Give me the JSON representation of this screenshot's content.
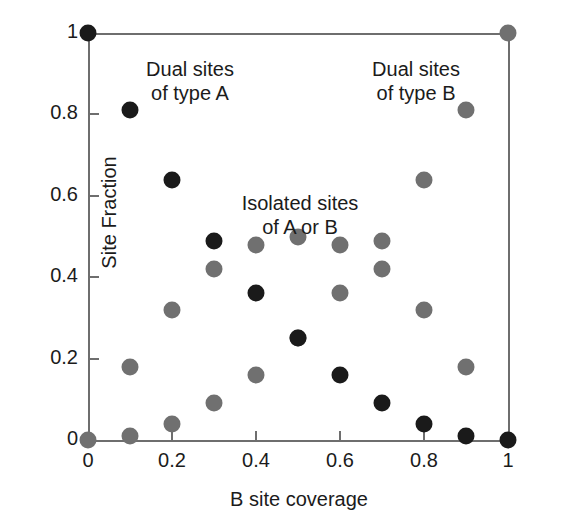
{
  "chart_data": {
    "type": "scatter",
    "title": "",
    "xlabel": "B site coverage",
    "ylabel": "Site Fraction",
    "xlim": [
      0,
      1
    ],
    "ylim": [
      0,
      1
    ],
    "grid": false,
    "legend": "none",
    "xticks": [
      "0",
      "0.2",
      "0.4",
      "0.6",
      "0.8",
      "1"
    ],
    "xtick_values": [
      0,
      0.2,
      0.4,
      0.6,
      0.8,
      1
    ],
    "yticks": [
      "0",
      "0.2",
      "0.4",
      "0.6",
      "0.8",
      "1"
    ],
    "ytick_values": [
      0,
      0.2,
      0.4,
      0.6,
      0.8,
      1
    ],
    "colors": {
      "dark": "#1a1a1a",
      "gray": "#707070",
      "axis": "#6e6e6e",
      "text": "#1b1b1b",
      "background": "#ffffff"
    },
    "series": [
      {
        "name": "Dual sites of type A",
        "color": "#1a1a1a",
        "points": [
          {
            "x": 0.0,
            "y": 1.0
          },
          {
            "x": 0.1,
            "y": 0.81
          },
          {
            "x": 0.2,
            "y": 0.64
          },
          {
            "x": 0.3,
            "y": 0.49
          },
          {
            "x": 0.4,
            "y": 0.36
          },
          {
            "x": 0.5,
            "y": 0.25
          },
          {
            "x": 0.6,
            "y": 0.16
          },
          {
            "x": 0.7,
            "y": 0.09
          },
          {
            "x": 0.8,
            "y": 0.04
          },
          {
            "x": 0.9,
            "y": 0.01
          },
          {
            "x": 1.0,
            "y": 0.0
          }
        ]
      },
      {
        "name": "Dual sites of type B",
        "color": "#707070",
        "points": [
          {
            "x": 0.0,
            "y": 0.0
          },
          {
            "x": 0.1,
            "y": 0.01
          },
          {
            "x": 0.2,
            "y": 0.04
          },
          {
            "x": 0.3,
            "y": 0.09
          },
          {
            "x": 0.4,
            "y": 0.16
          },
          {
            "x": 0.5,
            "y": 0.25
          },
          {
            "x": 0.6,
            "y": 0.36
          },
          {
            "x": 0.7,
            "y": 0.49
          },
          {
            "x": 0.8,
            "y": 0.64
          },
          {
            "x": 0.9,
            "y": 0.81
          },
          {
            "x": 1.0,
            "y": 1.0
          }
        ]
      },
      {
        "name": "Isolated sites of A or B",
        "color": "#707070",
        "points": [
          {
            "x": 0.1,
            "y": 0.18
          },
          {
            "x": 0.2,
            "y": 0.32
          },
          {
            "x": 0.3,
            "y": 0.42
          },
          {
            "x": 0.4,
            "y": 0.48
          },
          {
            "x": 0.5,
            "y": 0.5
          },
          {
            "x": 0.6,
            "y": 0.48
          },
          {
            "x": 0.7,
            "y": 0.42
          },
          {
            "x": 0.8,
            "y": 0.32
          },
          {
            "x": 0.9,
            "y": 0.18
          }
        ]
      }
    ],
    "annotations": [
      {
        "id": "dual-a",
        "text": "Dual sites\nof type A"
      },
      {
        "id": "dual-b",
        "text": "Dual sites\nof type B"
      },
      {
        "id": "isolated",
        "text": "Isolated sites\nof A or B"
      }
    ]
  },
  "annotations": {
    "dual_a": "Dual sites\nof type A",
    "dual_b": "Dual sites\nof type B",
    "isolated": "Isolated sites\nof A or B"
  },
  "axes": {
    "x_title": "B site coverage",
    "y_title": "Site Fraction"
  }
}
